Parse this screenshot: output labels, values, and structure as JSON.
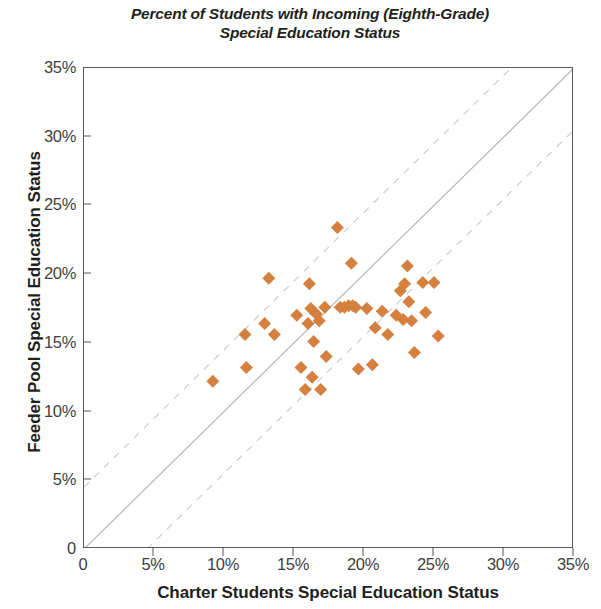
{
  "chart_data": {
    "type": "scatter",
    "title": "Percent of Students with Incoming (Eighth-Grade) Special Education Status",
    "title_line1": "Percent of Students with Incoming (Eighth-Grade)",
    "title_line2": "Special Education Status",
    "xlabel": "Charter Students Special Education Status",
    "ylabel": "Feeder Pool Special Education Status",
    "xlim": [
      0,
      35
    ],
    "ylim": [
      0,
      35
    ],
    "grid": false,
    "legend": null,
    "xticks": [
      0,
      5,
      10,
      15,
      20,
      25,
      30,
      35
    ],
    "yticks": [
      0,
      5,
      10,
      15,
      20,
      25,
      30,
      35
    ],
    "xtick_labels": [
      "0",
      "5%",
      "10%",
      "15%",
      "20%",
      "25%",
      "30%",
      "35%"
    ],
    "ytick_labels": [
      "0",
      "5%",
      "10%",
      "15%",
      "20%",
      "25%",
      "30%",
      "35%"
    ],
    "marker": "diamond",
    "marker_color": "#d5803f",
    "marker_size": 13,
    "reference_lines": [
      {
        "name": "identity-line",
        "type": "solid",
        "slope": 1,
        "intercept": 0,
        "color": "#b8b8bc"
      },
      {
        "name": "upper-band-line",
        "type": "dashed",
        "slope": 1,
        "intercept": 4.5,
        "color": "#c9c9cd"
      },
      {
        "name": "lower-band-line",
        "type": "dashed",
        "slope": 1,
        "intercept": -4.5,
        "color": "#c9c9cd"
      }
    ],
    "points": [
      {
        "x": 9.2,
        "y": 12.2
      },
      {
        "x": 11.5,
        "y": 15.6
      },
      {
        "x": 11.6,
        "y": 13.2
      },
      {
        "x": 12.9,
        "y": 16.4
      },
      {
        "x": 13.2,
        "y": 19.7
      },
      {
        "x": 13.6,
        "y": 15.6
      },
      {
        "x": 15.2,
        "y": 17.0
      },
      {
        "x": 15.5,
        "y": 13.2
      },
      {
        "x": 15.8,
        "y": 11.6
      },
      {
        "x": 16.0,
        "y": 16.4
      },
      {
        "x": 16.1,
        "y": 19.3
      },
      {
        "x": 16.2,
        "y": 17.5
      },
      {
        "x": 16.3,
        "y": 12.5
      },
      {
        "x": 16.4,
        "y": 15.1
      },
      {
        "x": 16.6,
        "y": 17.1
      },
      {
        "x": 16.8,
        "y": 16.6
      },
      {
        "x": 16.9,
        "y": 11.6
      },
      {
        "x": 17.2,
        "y": 17.6
      },
      {
        "x": 17.3,
        "y": 14.0
      },
      {
        "x": 18.1,
        "y": 23.4
      },
      {
        "x": 18.3,
        "y": 17.6
      },
      {
        "x": 18.6,
        "y": 17.6
      },
      {
        "x": 18.9,
        "y": 17.7
      },
      {
        "x": 19.1,
        "y": 20.8
      },
      {
        "x": 19.2,
        "y": 17.7
      },
      {
        "x": 19.4,
        "y": 17.6
      },
      {
        "x": 19.6,
        "y": 13.1
      },
      {
        "x": 20.2,
        "y": 17.5
      },
      {
        "x": 20.6,
        "y": 13.4
      },
      {
        "x": 20.8,
        "y": 16.1
      },
      {
        "x": 21.3,
        "y": 17.3
      },
      {
        "x": 21.7,
        "y": 15.6
      },
      {
        "x": 22.3,
        "y": 17.0
      },
      {
        "x": 22.6,
        "y": 18.8
      },
      {
        "x": 22.8,
        "y": 16.7
      },
      {
        "x": 22.9,
        "y": 19.3
      },
      {
        "x": 23.1,
        "y": 20.6
      },
      {
        "x": 23.2,
        "y": 18.0
      },
      {
        "x": 23.4,
        "y": 16.6
      },
      {
        "x": 23.6,
        "y": 14.3
      },
      {
        "x": 24.2,
        "y": 19.4
      },
      {
        "x": 24.4,
        "y": 17.2
      },
      {
        "x": 25.0,
        "y": 19.4
      },
      {
        "x": 25.3,
        "y": 15.5
      }
    ]
  }
}
